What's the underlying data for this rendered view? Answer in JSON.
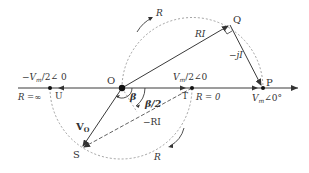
{
  "diagram": {
    "type": "phasor-circle-diagram",
    "colors": {
      "line": "#3a3a3a",
      "dashed": "#8a8a8a",
      "text": "#333333",
      "point": "#111111"
    },
    "points": {
      "O": {
        "label": "O",
        "x": 122,
        "y": 88
      },
      "P": {
        "label": "P",
        "x": 263,
        "y": 88
      },
      "Q": {
        "label": "Q",
        "x": 230,
        "y": 25
      },
      "S": {
        "label": "S",
        "x": 82,
        "y": 148
      },
      "T": {
        "label": "T",
        "x": 192,
        "y": 88
      },
      "U": {
        "label": "U",
        "x": 50,
        "y": 88
      }
    },
    "labels": {
      "neg_half": "−V",
      "neg_half_sub": "m",
      "neg_half_tail": "/2∠ 0",
      "pos_half": "V",
      "pos_half_sub": "m",
      "pos_half_tail": "/2∠0",
      "source": "V",
      "source_sub": "m",
      "source_tail": "∠0°",
      "r_inf": "R =∞",
      "r_zero": "R = 0",
      "ri": "RI",
      "neg_ri": "−RI",
      "neg_ji": "−jI",
      "vo": "V",
      "vo_sub": "O",
      "beta": "β",
      "beta_half": "β/2",
      "r_top": "R",
      "r_bottom": "R"
    }
  }
}
